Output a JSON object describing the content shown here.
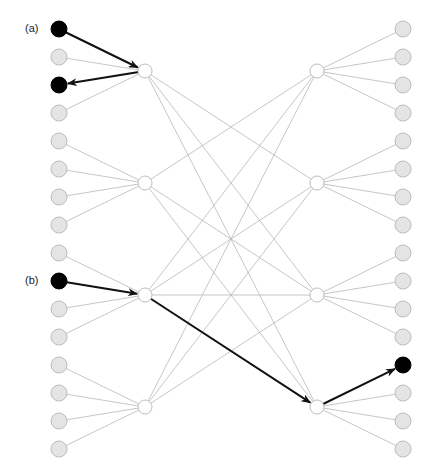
{
  "labels": [
    {
      "text": "(a)",
      "x": 25,
      "y": 22
    },
    {
      "text": "(b)",
      "x": 25,
      "y": 274
    }
  ],
  "layout": {
    "left_leaf_x": 59,
    "left_hub_x": 145,
    "right_hub_x": 317,
    "right_leaf_x": 403,
    "leaf_y_start": 29,
    "leaf_spacing": 28,
    "leaf_count": 16,
    "hub_y": [
      71,
      183,
      295,
      407
    ],
    "leaf_radius": 8,
    "hub_radius": 7
  },
  "colors": {
    "thin_edge": "#b8b8b8",
    "thick_edge": "#111111",
    "leaf_fill": "#e4e4e4",
    "active_fill": "#000000",
    "hub_fill": "#ffffff"
  },
  "active_left_leaves": [
    0,
    2,
    9
  ],
  "active_right_leaves": [
    12
  ],
  "hub_links": [
    [
      0,
      1
    ],
    [
      0,
      2
    ],
    [
      0,
      3
    ],
    [
      1,
      0
    ],
    [
      1,
      2
    ],
    [
      1,
      3
    ],
    [
      2,
      0
    ],
    [
      2,
      1
    ],
    [
      2,
      2
    ],
    [
      3,
      0
    ],
    [
      3,
      1
    ],
    [
      3,
      2
    ]
  ],
  "highlighted_paths": [
    {
      "name": "path-a",
      "segments": [
        {
          "from": "left_leaf:0",
          "to": "left_hub:0",
          "arrow": true
        },
        {
          "from": "left_hub:0",
          "to": "left_leaf:2",
          "arrow": true
        }
      ]
    },
    {
      "name": "path-b",
      "segments": [
        {
          "from": "left_leaf:9",
          "to": "left_hub:2",
          "arrow": true
        },
        {
          "from": "left_hub:2",
          "to": "right_hub:3",
          "arrow": true
        },
        {
          "from": "right_hub:3",
          "to": "right_leaf:12",
          "arrow": true
        }
      ]
    }
  ]
}
